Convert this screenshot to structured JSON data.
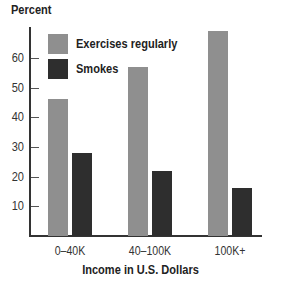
{
  "chart_data": {
    "type": "bar",
    "title": "",
    "ylabel": "Percent",
    "xlabel": "Income in U.S. Dollars",
    "categories": [
      "0–40K",
      "40–100K",
      "100K+"
    ],
    "series": [
      {
        "name": "Exercises regularly",
        "color": "#8f8f8f",
        "values": [
          46,
          57,
          69
        ]
      },
      {
        "name": "Smokes",
        "color": "#2e2e2e",
        "values": [
          28,
          22,
          16
        ]
      }
    ],
    "yticks": [
      10,
      20,
      30,
      40,
      50,
      60
    ],
    "ylim": [
      0,
      70
    ],
    "grid": false,
    "legend_position": "upper left"
  },
  "labels": {
    "ylabel": "Percent",
    "xlabel": "Income in U.S. Dollars",
    "legend": [
      "Exercises regularly",
      "Smokes"
    ],
    "categories": [
      "0–40K",
      "40–100K",
      "100K+"
    ],
    "yticks": [
      "10",
      "20",
      "30",
      "40",
      "50",
      "60"
    ]
  }
}
